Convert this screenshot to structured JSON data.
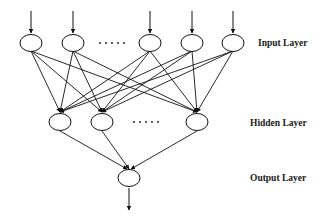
{
  "diagram": {
    "type": "feedforward-neural-network",
    "layers": [
      {
        "name": "input",
        "label": "Input Layer",
        "visible_nodes": 5,
        "ellipsis_after_index": 1
      },
      {
        "name": "hidden",
        "label": "Hidden Layer",
        "visible_nodes": 3,
        "ellipsis_after_index": 1
      },
      {
        "name": "output",
        "label": "Output Layer",
        "visible_nodes": 1
      }
    ],
    "ellipsis": "......",
    "colors": {
      "stroke": "#111111",
      "background": "#ffffff"
    }
  }
}
